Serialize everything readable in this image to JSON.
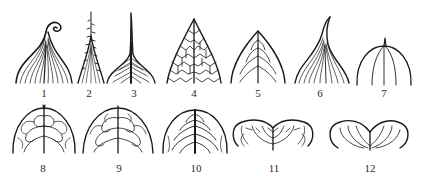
{
  "figure": {
    "type": "leaf-apex-shapes diagram",
    "stroke_color": "#1a1a1a",
    "background": "#ffffff",
    "rows": [
      {
        "row": 1,
        "items": [
          {
            "label": "1",
            "shape": "cirrhose apex (tendril-like curled tip, parallel veins)"
          },
          {
            "label": "2",
            "shape": "aristate apex (bristle tip, toothed)"
          },
          {
            "label": "3",
            "shape": "cuspidate apex (sharp stiff point, pinnate veins)"
          },
          {
            "label": "4",
            "shape": "acute apex (reticulate venation)"
          },
          {
            "label": "5",
            "shape": "acute apex (pinnate venation)"
          },
          {
            "label": "6",
            "shape": "acuminate apex (curved tip, parallel veins)"
          },
          {
            "label": "7",
            "shape": "mucronate apex (rounded with small point)"
          }
        ]
      },
      {
        "row": 2,
        "items": [
          {
            "label": "8",
            "shape": "mucronate obtuse apex (pinnate loops)"
          },
          {
            "label": "9",
            "shape": "obtuse apex (pinnate, brochidodromous)"
          },
          {
            "label": "10",
            "shape": "rounded apex (pinnate)"
          },
          {
            "label": "11",
            "shape": "emarginate / retuse apex (pinnate)"
          },
          {
            "label": "12",
            "shape": "obcordate apex (curved veins)"
          }
        ]
      }
    ],
    "caption": "· · · · ·"
  }
}
